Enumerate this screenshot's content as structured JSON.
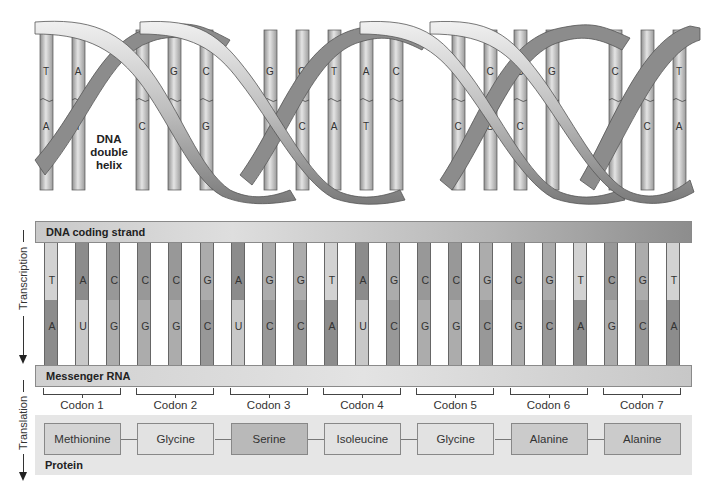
{
  "helix": {
    "label_lines": [
      "DNA",
      "double",
      "helix"
    ],
    "pairs": [
      {
        "x": 46,
        "top": "T",
        "bottom": "A"
      },
      {
        "x": 78,
        "top": "A",
        "bottom": "T"
      },
      {
        "x": 142,
        "top": "G",
        "bottom": "C"
      },
      {
        "x": 174,
        "top": "G",
        "bottom": "C"
      },
      {
        "x": 206,
        "top": "C",
        "bottom": "G"
      },
      {
        "x": 270,
        "top": "G",
        "bottom": ""
      },
      {
        "x": 302,
        "top": "G",
        "bottom": "C"
      },
      {
        "x": 334,
        "top": "T",
        "bottom": "A"
      },
      {
        "x": 366,
        "top": "A",
        "bottom": "T"
      },
      {
        "x": 396,
        "top": "C",
        "bottom": ""
      },
      {
        "x": 458,
        "top": "G",
        "bottom": "C"
      },
      {
        "x": 490,
        "top": "C",
        "bottom": "G"
      },
      {
        "x": 520,
        "top": "G",
        "bottom": "C"
      },
      {
        "x": 552,
        "top": "G",
        "bottom": ""
      },
      {
        "x": 615,
        "top": "C",
        "bottom": "G"
      },
      {
        "x": 647,
        "top": "G",
        "bottom": "C"
      },
      {
        "x": 679,
        "top": "T",
        "bottom": "A"
      }
    ]
  },
  "coding_strand": {
    "label": "DNA coding strand",
    "bases": [
      "T",
      "A",
      "C",
      "C",
      "C",
      "G",
      "A",
      "G",
      "G",
      "T",
      "A",
      "G",
      "C",
      "C",
      "G",
      "C",
      "G",
      "T",
      "C",
      "G",
      "T"
    ]
  },
  "mrna": {
    "label": "Messenger RNA",
    "bases": [
      "A",
      "U",
      "G",
      "G",
      "G",
      "C",
      "U",
      "C",
      "C",
      "A",
      "U",
      "C",
      "G",
      "G",
      "C",
      "G",
      "C",
      "A",
      "G",
      "C",
      "A"
    ]
  },
  "base_colors": {
    "T": "#d2d2d2",
    "A": "#8c8c8c",
    "C": "#989898",
    "G": "#acacac",
    "U": "#c8c8c8"
  },
  "process_labels": {
    "transcription": "Transcription",
    "translation": "Translation"
  },
  "codons": [
    "Codon 1",
    "Codon 2",
    "Codon 3",
    "Codon 4",
    "Codon 5",
    "Codon 6",
    "Codon 7"
  ],
  "protein": {
    "label": "Protein",
    "amino_acids": [
      {
        "name": "Methionine",
        "color": "#d4d4d4"
      },
      {
        "name": "Glycine",
        "color": "#e2e2e2"
      },
      {
        "name": "Serine",
        "color": "#b9b9b9"
      },
      {
        "name": "Isoleucine",
        "color": "#e2e2e2"
      },
      {
        "name": "Glycine",
        "color": "#e2e2e2"
      },
      {
        "name": "Alanine",
        "color": "#cbcbcb"
      },
      {
        "name": "Alanine",
        "color": "#cbcbcb"
      }
    ]
  }
}
